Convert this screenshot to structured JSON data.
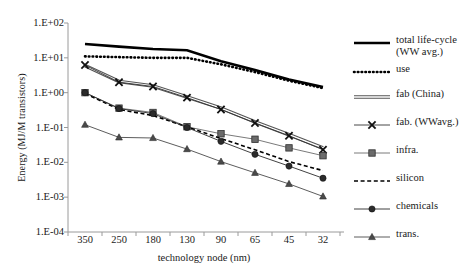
{
  "chart_data": {
    "type": "line",
    "title": "",
    "xlabel": "technology node (nm)",
    "ylabel": "Energy (MJ/M transistors)",
    "categories": [
      "350",
      "250",
      "180",
      "130",
      "90",
      "65",
      "45",
      "32"
    ],
    "x_tick_labels": [
      "350",
      "250",
      "180",
      "130",
      "90",
      "65",
      "45",
      "32"
    ],
    "y_tick_labels": [
      "1.E+02",
      "1.E+01",
      "1.E+00",
      "1.E-01",
      "1.E-02",
      "1.E-03",
      "1.E-04"
    ],
    "y_tick_values": [
      100,
      10,
      1,
      0.1,
      0.01,
      0.001,
      0.0001
    ],
    "yscale": "log",
    "ylim": [
      0.0001,
      100
    ],
    "grid": false,
    "legend_position": "right",
    "series": [
      {
        "name": "total life-cycle (WW avg.)",
        "legend_label": "total life-cycle\n(WW avg.)",
        "style": "solid-thick",
        "marker": "none",
        "color": "#000000",
        "values": [
          25.0,
          21.0,
          18.0,
          16.5,
          8.0,
          4.5,
          2.4,
          1.45
        ]
      },
      {
        "name": "use",
        "legend_label": "use",
        "style": "dotted-thick",
        "marker": "none",
        "color": "#000000",
        "values": [
          11.0,
          10.5,
          10.0,
          10.0,
          6.5,
          3.9,
          2.2,
          1.35
        ]
      },
      {
        "name": "fab (China)",
        "legend_label": "fab (China)",
        "style": "double-line",
        "marker": "none",
        "color": "#555555",
        "values": [
          6.0,
          2.1,
          1.55,
          0.75,
          0.36,
          0.145,
          0.062,
          0.026
        ]
      },
      {
        "name": "fab. (WWavg.)",
        "legend_label": "fab. (WWavg.)",
        "style": "solid-thin",
        "marker": "x",
        "color": "#333333",
        "values": [
          6.2,
          2.0,
          1.5,
          0.72,
          0.33,
          0.135,
          0.058,
          0.023
        ]
      },
      {
        "name": "infra.",
        "legend_label": "infra.",
        "style": "solid-thin",
        "marker": "square",
        "color": "#6b6b6b",
        "values": [
          1.0,
          0.36,
          0.27,
          0.105,
          0.066,
          0.046,
          0.026,
          0.0155
        ]
      },
      {
        "name": "silicon",
        "legend_label": "silicon",
        "style": "dashed",
        "marker": "none",
        "color": "#000000",
        "values": [
          0.95,
          0.33,
          0.22,
          0.105,
          0.048,
          0.023,
          0.0105,
          0.0058
        ]
      },
      {
        "name": "chemicals",
        "legend_label": "chemicals",
        "style": "solid-thin",
        "marker": "circle",
        "color": "#2b2b2b",
        "values": [
          1.0,
          0.35,
          0.25,
          0.1,
          0.04,
          0.017,
          0.0078,
          0.0035
        ]
      },
      {
        "name": "trans.",
        "legend_label": "trans.",
        "style": "solid-thin",
        "marker": "triangle",
        "color": "#4a4a4a",
        "values": [
          0.12,
          0.052,
          0.05,
          0.024,
          0.0105,
          0.005,
          0.0024,
          0.00105
        ]
      }
    ]
  },
  "axes": {
    "x_axis_title": "technology node (nm)",
    "y_axis_title": "Energy (MJ/M transistors)"
  }
}
